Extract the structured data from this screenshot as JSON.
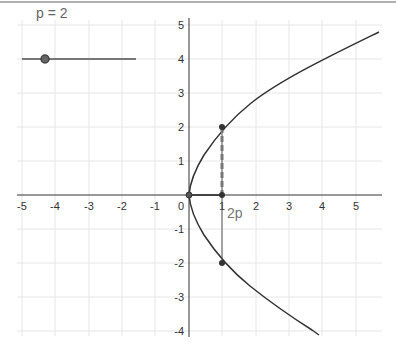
{
  "slider": {
    "label": "p = 2",
    "name": "p",
    "value": 2
  },
  "annotation": {
    "segment_label": "2p"
  },
  "axes": {
    "x_ticks": [
      "-5",
      "-4",
      "-3",
      "-2",
      "-1",
      "0",
      "1",
      "2",
      "3",
      "4",
      "5"
    ],
    "y_ticks": [
      "5",
      "4",
      "3",
      "2",
      "1",
      "-1",
      "-2",
      "-3",
      "-4"
    ]
  },
  "curve": {
    "equation": "y^2 = 4x",
    "color": "#333333"
  },
  "points": [
    {
      "name": "vertex",
      "x": 0,
      "y": 0
    },
    {
      "name": "focus",
      "x": 1,
      "y": 0
    },
    {
      "name": "upper",
      "x": 1,
      "y": 2
    },
    {
      "name": "lower",
      "x": 1,
      "y": -2
    }
  ]
}
